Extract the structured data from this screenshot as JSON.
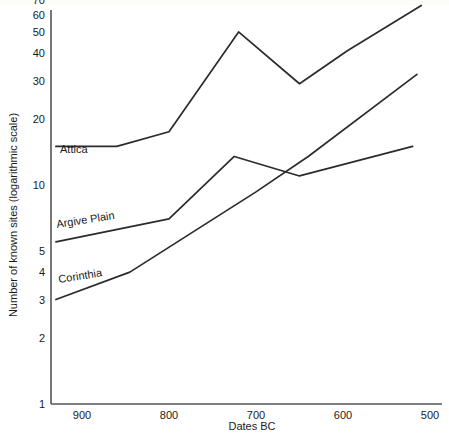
{
  "chart_data": {
    "type": "line",
    "title": "",
    "xlabel": "Dates BC",
    "ylabel": "Number of known sites (logarithmic scale)",
    "yscale": "log",
    "ylim": [
      1,
      75
    ],
    "xlim": [
      930,
      495
    ],
    "x_reversed": true,
    "grid": false,
    "legend": "inline-labels",
    "x_ticks": [
      900,
      800,
      700,
      600,
      500
    ],
    "x_tick_labels": [
      "900",
      "800",
      "700",
      "600",
      "500"
    ],
    "y_ticks": [
      1,
      2,
      3,
      4,
      5,
      10,
      20,
      30,
      40,
      50,
      60,
      70
    ],
    "y_tick_labels": [
      "1",
      "2",
      "3",
      "4",
      "5",
      "10",
      "20",
      "30",
      "40",
      "50",
      "60",
      "70"
    ],
    "series": [
      {
        "name": "Attica",
        "label": "Attica",
        "color": "#2b2b2b",
        "x": [
          930,
          860,
          800,
          720,
          650,
          595,
          510
        ],
        "values": [
          15,
          15,
          17.5,
          50,
          29,
          41,
          66
        ]
      },
      {
        "name": "Argive Plain",
        "label": "Argive Plain",
        "color": "#2b2b2b",
        "x": [
          930,
          800,
          725,
          650,
          520
        ],
        "values": [
          5.5,
          7,
          13.5,
          11,
          15
        ]
      },
      {
        "name": "Corinthia",
        "label": "Corinthia",
        "color": "#2b2b2b",
        "x": [
          930,
          845,
          700,
          640,
          515
        ],
        "values": [
          3,
          4,
          9.3,
          13.5,
          32
        ]
      }
    ]
  },
  "axes": {
    "x_axis_name": "Dates BC",
    "y_axis_name": "Number of known sites (logarithmic scale)"
  }
}
